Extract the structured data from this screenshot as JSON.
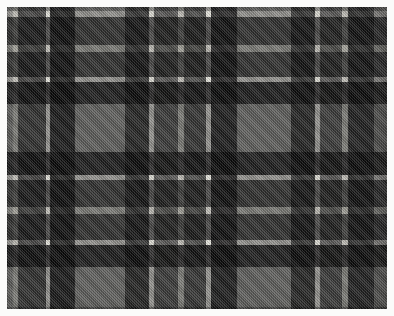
{
  "image": {
    "subject": "tartan-plaid-fabric-swatch",
    "width": 394,
    "height": 316,
    "border_color": "#fbfbfa",
    "border_width": 7,
    "swatch": {
      "x": 7,
      "y": 7,
      "width": 380,
      "height": 302
    }
  },
  "palette": {
    "light_gray": "#9b9b99",
    "medium_gray": "#6e6e6d",
    "dark_gray": "#3d3d3d",
    "near_black": "#1c1c1c",
    "white_stripe": "#f0efeb",
    "pale_stripe": "#c9c8c3"
  },
  "chart_data": {
    "type": "heatmap",
    "xlabel": "warp threads (px)",
    "ylabel": "weft threads (px)",
    "grid": false,
    "legend": "none",
    "base_color": "#9b9b99",
    "warp": [
      {
        "start": 0,
        "width": 6,
        "color": "#9b9b99",
        "name": "light"
      },
      {
        "start": 6,
        "width": 5,
        "color": "#c9c8c3",
        "name": "pale"
      },
      {
        "start": 11,
        "width": 28,
        "color": "#4c4c4c",
        "name": "dark"
      },
      {
        "start": 39,
        "width": 4,
        "color": "#f0efeb",
        "name": "white"
      },
      {
        "start": 43,
        "width": 25,
        "color": "#2a2a2a",
        "name": "black"
      },
      {
        "start": 68,
        "width": 50,
        "color": "#9b9b99",
        "name": "light"
      },
      {
        "start": 118,
        "width": 24,
        "color": "#3a3a3a",
        "name": "dark"
      },
      {
        "start": 142,
        "width": 5,
        "color": "#f0efeb",
        "name": "white"
      },
      {
        "start": 147,
        "width": 24,
        "color": "#5f5f5e",
        "name": "medium"
      },
      {
        "start": 171,
        "width": 6,
        "color": "#c9c8c3",
        "name": "pale"
      },
      {
        "start": 177,
        "width": 22,
        "color": "#555554",
        "name": "medium"
      },
      {
        "start": 199,
        "width": 5,
        "color": "#f0efeb",
        "name": "white"
      },
      {
        "start": 204,
        "width": 26,
        "color": "#2e2e2e",
        "name": "black"
      },
      {
        "start": 230,
        "width": 54,
        "color": "#9b9b99",
        "name": "light"
      },
      {
        "start": 284,
        "width": 24,
        "color": "#3a3a3a",
        "name": "dark"
      },
      {
        "start": 308,
        "width": 5,
        "color": "#f0efeb",
        "name": "white"
      },
      {
        "start": 313,
        "width": 22,
        "color": "#5f5f5e",
        "name": "medium"
      },
      {
        "start": 335,
        "width": 6,
        "color": "#c9c8c3",
        "name": "pale"
      },
      {
        "start": 341,
        "width": 26,
        "color": "#343434",
        "name": "dark"
      },
      {
        "start": 367,
        "width": 13,
        "color": "#7b7b7a",
        "name": "medium"
      }
    ],
    "weft": [
      {
        "start": 0,
        "height": 4,
        "color": "#9b9b99",
        "name": "light"
      },
      {
        "start": 4,
        "height": 6,
        "color": "#f0efeb",
        "name": "white"
      },
      {
        "start": 10,
        "height": 28,
        "color": "#4c4c4c",
        "name": "dark"
      },
      {
        "start": 38,
        "height": 7,
        "color": "#c9c8c3",
        "name": "pale"
      },
      {
        "start": 45,
        "height": 25,
        "color": "#4c4c4c",
        "name": "dark"
      },
      {
        "start": 70,
        "height": 5,
        "color": "#f0efeb",
        "name": "white"
      },
      {
        "start": 75,
        "height": 22,
        "color": "#2e2e2e",
        "name": "black"
      },
      {
        "start": 97,
        "height": 48,
        "color": "#9b9b99",
        "name": "light"
      },
      {
        "start": 145,
        "height": 23,
        "color": "#2e2e2e",
        "name": "black"
      },
      {
        "start": 168,
        "height": 5,
        "color": "#f0efeb",
        "name": "white"
      },
      {
        "start": 173,
        "height": 27,
        "color": "#4c4c4c",
        "name": "dark"
      },
      {
        "start": 200,
        "height": 7,
        "color": "#c9c8c3",
        "name": "pale"
      },
      {
        "start": 207,
        "height": 26,
        "color": "#4c4c4c",
        "name": "dark"
      },
      {
        "start": 233,
        "height": 5,
        "color": "#f0efeb",
        "name": "white"
      },
      {
        "start": 238,
        "height": 22,
        "color": "#2e2e2e",
        "name": "black"
      },
      {
        "start": 260,
        "height": 40,
        "color": "#9b9b99",
        "name": "light"
      },
      {
        "start": 300,
        "height": 2,
        "color": "#6e6e6d",
        "name": "medium"
      }
    ]
  }
}
